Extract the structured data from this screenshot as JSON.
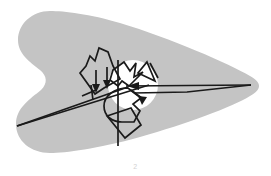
{
  "figure": {
    "title": "",
    "caption": "2",
    "background_color": "#ffffff",
    "region_fill_color": "#c4c4c4",
    "highlight_fill_color": "#ffffff",
    "stroke_color": "#1a1a1a",
    "canvas": {
      "width": 271,
      "height": 176
    },
    "region": {
      "name": "boomerang-shaped-region",
      "description": "large rounded wing / boomerang shaped gray region, bilobed concave notch at left, tapering point at right"
    },
    "highlight_circle": {
      "name": "white-highlight-disc",
      "cx": 133,
      "cy": 85,
      "r": 25
    },
    "vectors": [
      {
        "name": "long-left-upper-ray",
        "from": [
          17,
          125
        ],
        "to": [
          150,
          86
        ]
      },
      {
        "name": "long-left-lower-ray",
        "from": [
          17,
          125
        ],
        "to": [
          128,
          86
        ]
      },
      {
        "name": "long-right-wedge-upper",
        "from": [
          128,
          86
        ],
        "to": [
          251,
          86
        ]
      },
      {
        "name": "long-right-wedge-lower",
        "from": [
          251,
          86
        ],
        "to": [
          135,
          93
        ]
      },
      {
        "name": "vertical-axis",
        "from": [
          118,
          62
        ],
        "to": [
          118,
          146
        ]
      },
      {
        "name": "down-arrow-left",
        "from": [
          96,
          72
        ],
        "to": [
          96,
          90
        ]
      },
      {
        "name": "down-arrow-inner",
        "from": [
          106,
          70
        ],
        "to": [
          106,
          86
        ]
      },
      {
        "name": "diagonal-arrow-lower-right",
        "from": [
          130,
          90
        ],
        "to": [
          146,
          102
        ]
      }
    ],
    "polygons": [
      {
        "name": "star-polygon-upper-left"
      },
      {
        "name": "chevron-polygon-center"
      },
      {
        "name": "triangle-polygon-upper-right"
      },
      {
        "name": "lobe-polygon-lower-center"
      },
      {
        "name": "diamond-polygon-lower"
      }
    ],
    "labels": []
  }
}
